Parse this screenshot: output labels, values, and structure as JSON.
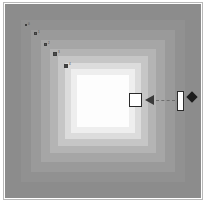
{
  "figure": {
    "canvas": {
      "width": 207,
      "height": 204,
      "background": "#ffffff"
    },
    "frame": {
      "border_color": "#b9b9b9",
      "fill": "#ffffff"
    },
    "corner_tick": "⌐"
  },
  "chart_data": {
    "type": "heatmap",
    "subtitle": "",
    "xlabel": "",
    "ylabel": "",
    "colormap": "grayscale",
    "grid": false,
    "legend": "none",
    "bands": [
      {
        "index": 0,
        "level": 0.47,
        "color": "#8c8c8c",
        "inset": 0
      },
      {
        "index": 1,
        "level": 0.52,
        "color": "#919191",
        "inset": 16
      },
      {
        "index": 2,
        "level": 0.57,
        "color": "#9a9a9a",
        "inset": 26
      },
      {
        "index": 3,
        "level": 0.63,
        "color": "#a6a6a6",
        "inset": 36
      },
      {
        "index": 4,
        "level": 0.7,
        "color": "#b4b4b4",
        "inset": 45
      },
      {
        "index": 5,
        "level": 0.78,
        "color": "#c6c6c6",
        "inset": 53
      },
      {
        "index": 6,
        "level": 0.86,
        "color": "#dcdcdc",
        "inset": 60
      },
      {
        "index": 7,
        "level": 0.93,
        "color": "#eeeeee",
        "inset": 66
      },
      {
        "index": 8,
        "level": 1.0,
        "color": "#fdfdfd",
        "inset": 72
      }
    ],
    "markers": [
      {
        "id": "m1",
        "label": "0",
        "x": 25,
        "y": 24,
        "size": 2,
        "color": "#6a6a6a"
      },
      {
        "id": "m2",
        "label": "1",
        "x": 34,
        "y": 32,
        "size": 3,
        "color": "#5d5d5d"
      },
      {
        "id": "m3",
        "label": "2",
        "x": 44,
        "y": 43,
        "size": 3,
        "color": "#555555"
      },
      {
        "id": "m4",
        "label": "3",
        "x": 53,
        "y": 52,
        "size": 4,
        "color": "#4a4a4a"
      },
      {
        "id": "m5",
        "label": "4",
        "x": 64,
        "y": 64,
        "size": 4,
        "color": "#414141"
      }
    ],
    "annotation": {
      "target_square": {
        "x": 129,
        "y": 93,
        "width": 13,
        "height": 14,
        "fill": "#ffffff",
        "stroke": "#2b2b2b"
      },
      "arrow": {
        "direction": "left",
        "x": 145,
        "y": 95,
        "color": "#3a3a3a"
      },
      "connector": {
        "style": "dashed",
        "x1": 156,
        "y1": 100,
        "x2": 175,
        "y2": 100,
        "color": "#6e6e6e"
      },
      "vertical_bar": {
        "x": 177,
        "y": 91,
        "width": 7,
        "height": 20,
        "fill": "#ffffff",
        "stroke": "#2b2b2b"
      },
      "diamond": {
        "x": 188,
        "y": 93,
        "size": 11,
        "color": "#1c1c1c"
      }
    },
    "axis_ranges": {
      "xlim": [
        0,
        196
      ],
      "ylim": [
        0,
        194
      ]
    }
  }
}
